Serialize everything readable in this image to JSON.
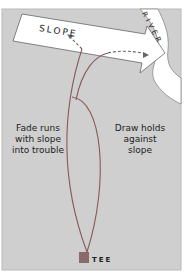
{
  "labels": {
    "slope": "SLOPE",
    "river": "RIVER",
    "fade": "Fade runs with slope into trouble",
    "fade_lines": [
      "Fade runs",
      "with slope",
      "into trouble"
    ],
    "draw_lines": [
      "Draw holds",
      "against",
      "slope"
    ],
    "tee": "TEE"
  },
  "colors": {
    "background": "#cfcfcf",
    "arrow_fill": "#ffffff",
    "river_fill": "#ffffff",
    "line": "#8a5a5a",
    "dash": "#666666",
    "tee": "#8a6a6a",
    "frame": "#b9b9b9"
  }
}
